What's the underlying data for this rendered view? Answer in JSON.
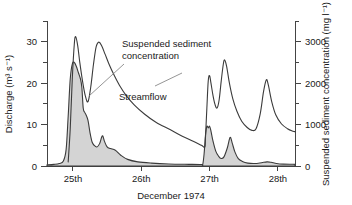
{
  "chart_data": {
    "type": "area",
    "title": "",
    "xlabel": "December 1974",
    "x_tick_labels": [
      "25th",
      "26th",
      "27th",
      "28th"
    ],
    "x_tick_values": [
      25,
      26,
      27,
      28
    ],
    "xlim": [
      24.62,
      28.25
    ],
    "grid": false,
    "legend_position": "inline-annotations",
    "axes": {
      "left": {
        "label": "Discharge (m³ s⁻¹)",
        "ticks": [
          0,
          10,
          20,
          30
        ],
        "tick_labels": [
          "0",
          "10",
          "20",
          "30"
        ],
        "minor_ticks": [
          5,
          15,
          25,
          35
        ],
        "lim": [
          0,
          35
        ]
      },
      "right": {
        "label": "Suspended sediment concentration (mg l⁻¹)",
        "ticks": [
          0,
          1000,
          2000,
          3000
        ],
        "tick_labels": [
          "0",
          "1000",
          "2000",
          "3000"
        ],
        "minor_ticks": [
          500,
          1500,
          2500,
          3500
        ],
        "lim": [
          0,
          3500
        ]
      }
    },
    "annotations": [
      {
        "name": "suspended-sediment-concentration",
        "text_line1": "Suspended sediment",
        "text_line2": "concentration",
        "text": "Suspended sediment concentration"
      },
      {
        "name": "streamflow",
        "text": "Streamflow"
      }
    ],
    "series": [
      {
        "name": "Streamflow",
        "axis": "left",
        "units": "m3/s",
        "style": "shaded-area",
        "fill_color": "#d2d2d2",
        "line_color": "#3b3b3b",
        "points": [
          [
            24.62,
            0.3
          ],
          [
            24.72,
            0.4
          ],
          [
            24.8,
            0.6
          ],
          [
            24.86,
            1.2
          ],
          [
            24.9,
            4.0
          ],
          [
            24.93,
            12.0
          ],
          [
            24.96,
            21.0
          ],
          [
            24.99,
            24.6
          ],
          [
            25.02,
            25.0
          ],
          [
            25.05,
            24.0
          ],
          [
            25.08,
            22.5
          ],
          [
            25.11,
            21.0
          ],
          [
            25.13,
            19.0
          ],
          [
            25.15,
            14.0
          ],
          [
            25.17,
            13.0
          ],
          [
            25.19,
            12.4
          ],
          [
            25.22,
            11.0
          ],
          [
            25.25,
            8.0
          ],
          [
            25.28,
            5.8
          ],
          [
            25.31,
            5.0
          ],
          [
            25.35,
            4.6
          ],
          [
            25.39,
            5.4
          ],
          [
            25.43,
            7.3
          ],
          [
            25.46,
            6.0
          ],
          [
            25.5,
            4.6
          ],
          [
            25.55,
            4.2
          ],
          [
            25.62,
            3.8
          ],
          [
            25.7,
            2.6
          ],
          [
            25.8,
            1.6
          ],
          [
            25.95,
            1.0
          ],
          [
            26.15,
            0.7
          ],
          [
            26.4,
            0.5
          ],
          [
            26.7,
            0.4
          ],
          [
            26.88,
            0.35
          ],
          [
            26.9,
            0.4
          ],
          [
            26.92,
            3.0
          ],
          [
            26.94,
            7.5
          ],
          [
            26.96,
            9.6
          ],
          [
            26.98,
            9.2
          ],
          [
            27.0,
            9.6
          ],
          [
            27.02,
            8.4
          ],
          [
            27.05,
            6.0
          ],
          [
            27.09,
            3.6
          ],
          [
            27.13,
            2.4
          ],
          [
            27.17,
            1.8
          ],
          [
            27.21,
            2.2
          ],
          [
            27.26,
            4.4
          ],
          [
            27.3,
            6.9
          ],
          [
            27.33,
            5.6
          ],
          [
            27.37,
            3.4
          ],
          [
            27.42,
            1.8
          ],
          [
            27.48,
            1.1
          ],
          [
            27.56,
            0.7
          ],
          [
            27.66,
            0.6
          ],
          [
            27.76,
            0.8
          ],
          [
            27.84,
            1.0
          ],
          [
            27.9,
            0.9
          ],
          [
            27.98,
            0.6
          ],
          [
            28.08,
            0.45
          ],
          [
            28.25,
            0.4
          ]
        ]
      },
      {
        "name": "Suspended sediment concentration",
        "axis": "right",
        "units": "mg/l",
        "style": "line",
        "line_color": "#3b3b3b",
        "points": [
          [
            24.93,
            100
          ],
          [
            24.96,
            900
          ],
          [
            24.99,
            2100
          ],
          [
            25.02,
            2950
          ],
          [
            25.04,
            3120
          ],
          [
            25.07,
            2900
          ],
          [
            25.1,
            2500
          ],
          [
            25.14,
            2050
          ],
          [
            25.18,
            1700
          ],
          [
            25.22,
            1550
          ],
          [
            25.26,
            1900
          ],
          [
            25.3,
            2450
          ],
          [
            25.34,
            2880
          ],
          [
            25.38,
            2990
          ],
          [
            25.42,
            2900
          ],
          [
            25.47,
            2700
          ],
          [
            25.53,
            2450
          ],
          [
            25.6,
            2200
          ],
          [
            25.68,
            1950
          ],
          [
            25.78,
            1700
          ],
          [
            25.9,
            1470
          ],
          [
            26.05,
            1250
          ],
          [
            26.22,
            1050
          ],
          [
            26.42,
            880
          ],
          [
            26.6,
            720
          ],
          [
            26.76,
            600
          ],
          [
            26.88,
            500
          ],
          [
            26.93,
            460
          ],
          [
            26.94,
            700
          ],
          [
            26.96,
            1400
          ],
          [
            26.98,
            2050
          ],
          [
            27.0,
            2180
          ],
          [
            27.02,
            2000
          ],
          [
            27.05,
            1700
          ],
          [
            27.08,
            1480
          ],
          [
            27.11,
            1400
          ],
          [
            27.14,
            1600
          ],
          [
            27.17,
            2050
          ],
          [
            27.2,
            2450
          ],
          [
            27.22,
            2560
          ],
          [
            27.25,
            2400
          ],
          [
            27.29,
            2000
          ],
          [
            27.34,
            1620
          ],
          [
            27.4,
            1320
          ],
          [
            27.47,
            1080
          ],
          [
            27.55,
            930
          ],
          [
            27.62,
            860
          ],
          [
            27.68,
            900
          ],
          [
            27.74,
            1250
          ],
          [
            27.79,
            1800
          ],
          [
            27.83,
            2080
          ],
          [
            27.86,
            1950
          ],
          [
            27.91,
            1550
          ],
          [
            27.97,
            1230
          ],
          [
            28.05,
            1020
          ],
          [
            28.14,
            900
          ],
          [
            28.22,
            840
          ],
          [
            28.25,
            830
          ]
        ]
      }
    ]
  }
}
